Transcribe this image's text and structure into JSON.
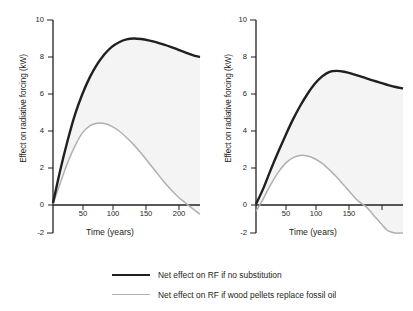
{
  "chart_data": [
    {
      "type": "line",
      "panel": "left",
      "title": "",
      "xlabel": "Time (years)",
      "ylabel": "Effect on radiative forcing (kW)",
      "xlim": [
        0,
        200
      ],
      "ylim": [
        -2,
        10
      ],
      "xticks": [
        50,
        100,
        150,
        200
      ],
      "yticks": [
        -2,
        0,
        2,
        4,
        6,
        8,
        10
      ],
      "grid": false,
      "legend_position": "below-figure",
      "shaded_between_series": true,
      "series": [
        {
          "name": "Net effect on RF if no substitution",
          "color": "#231f20",
          "x": [
            0,
            10,
            20,
            30,
            40,
            50,
            60,
            70,
            80,
            90,
            100,
            110,
            120,
            130,
            140,
            150,
            160,
            170,
            180,
            190,
            200
          ],
          "values": [
            0.1,
            1.9,
            3.5,
            4.9,
            6.0,
            6.9,
            7.6,
            8.15,
            8.55,
            8.8,
            8.95,
            9.0,
            8.97,
            8.9,
            8.8,
            8.68,
            8.55,
            8.4,
            8.25,
            8.1,
            8.0
          ]
        },
        {
          "name": "Net effect on RF if wood pellets replace fossil oil",
          "color": "#b0b0b0",
          "x": [
            0,
            10,
            20,
            30,
            40,
            50,
            60,
            70,
            80,
            90,
            100,
            110,
            120,
            130,
            140,
            150,
            160,
            170,
            180,
            190,
            200
          ],
          "values": [
            0.05,
            1.2,
            2.3,
            3.2,
            3.9,
            4.28,
            4.42,
            4.4,
            4.25,
            4.0,
            3.65,
            3.25,
            2.8,
            2.3,
            1.8,
            1.3,
            0.85,
            0.45,
            0.12,
            -0.2,
            -0.5
          ]
        }
      ]
    },
    {
      "type": "line",
      "panel": "right",
      "title": "",
      "xlabel": "Time (years)",
      "ylabel": "Effect on radiative forcing (kW)",
      "xlim": [
        0,
        200
      ],
      "ylim": [
        -2,
        10
      ],
      "xticks": [
        50,
        100,
        150,
        200
      ],
      "yticks": [
        -2,
        0,
        2,
        4,
        6,
        8,
        10
      ],
      "grid": false,
      "legend_position": "below-figure",
      "shaded_between_series": true,
      "series": [
        {
          "name": "Net effect on RF if no substitution",
          "color": "#231f20",
          "x": [
            0,
            10,
            20,
            30,
            40,
            50,
            60,
            70,
            80,
            90,
            100,
            110,
            120,
            130,
            140,
            150,
            160,
            170,
            180,
            190,
            200
          ],
          "values": [
            0.05,
            0.9,
            1.9,
            2.85,
            3.75,
            4.6,
            5.35,
            6.0,
            6.55,
            6.95,
            7.2,
            7.25,
            7.2,
            7.1,
            6.98,
            6.85,
            6.72,
            6.6,
            6.48,
            6.38,
            6.3
          ]
        },
        {
          "name": "Net effect on RF if wood pellets replace fossil oil",
          "color": "#b0b0b0",
          "x": [
            0,
            10,
            20,
            30,
            40,
            50,
            60,
            70,
            80,
            90,
            100,
            110,
            120,
            130,
            140,
            150,
            160,
            170,
            180,
            190,
            200
          ],
          "values": [
            -0.35,
            0.35,
            1.1,
            1.75,
            2.25,
            2.55,
            2.68,
            2.65,
            2.5,
            2.25,
            1.9,
            1.5,
            1.05,
            0.6,
            0.18,
            -0.1,
            -0.55,
            -1.0,
            -1.4,
            -1.75,
            -2.1
          ]
        }
      ]
    }
  ],
  "panels": {
    "left": {
      "ylabel": "Effect on radiative forcing (kW)",
      "xlabel": "Time (years)",
      "yticks": [
        "10",
        "8",
        "6",
        "4",
        "2",
        "0",
        "-2"
      ],
      "xticks": [
        "50",
        "100",
        "150",
        "200"
      ]
    },
    "right": {
      "ylabel": "Effect on radiative forcing (kW)",
      "xlabel": "Time (years)",
      "yticks": [
        "10",
        "8",
        "6",
        "4",
        "2",
        "0",
        "-2"
      ],
      "xticks": [
        "50",
        "100",
        "150",
        "200"
      ]
    }
  },
  "legend": {
    "items": [
      {
        "label": "Net effect on RF if no substitution",
        "color": "#231f20",
        "style": "thick-black"
      },
      {
        "label": "Net effect on RF if wood pellets replace fossil oil",
        "color": "#b0b0b0",
        "style": "thin-gray"
      }
    ]
  },
  "colors": {
    "line_black": "#231f20",
    "line_gray": "#b0b0b0",
    "fill_band": "#f4f4f4",
    "axis": "#231f20",
    "background": "#ffffff"
  }
}
